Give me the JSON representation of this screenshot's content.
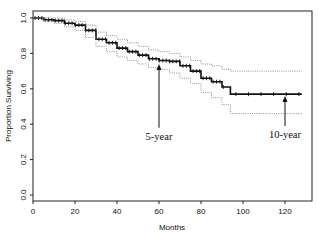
{
  "chart_data": {
    "type": "line",
    "title": "",
    "xlabel": "Months",
    "ylabel": "Proportion Surviving",
    "xlim": [
      0,
      130
    ],
    "ylim": [
      0,
      1.0
    ],
    "x_ticks": [
      0,
      20,
      40,
      60,
      80,
      100,
      120
    ],
    "y_ticks": [
      0.0,
      0.2,
      0.4,
      0.6,
      0.8,
      1.0
    ],
    "x_tick_labels": [
      "0",
      "20",
      "40",
      "60",
      "80",
      "100",
      "120"
    ],
    "y_tick_labels": [
      "0.0",
      "0.2",
      "0.4",
      "0.6",
      "0.8",
      "1.0"
    ],
    "grid": false,
    "legend": null,
    "series": [
      {
        "name": "Kaplan-Meier estimate",
        "style": "step-solid-with-censor-marks",
        "x": [
          0,
          5,
          10,
          15,
          20,
          25,
          30,
          35,
          40,
          45,
          50,
          55,
          60,
          65,
          70,
          75,
          80,
          85,
          90,
          94,
          100,
          110,
          120,
          128
        ],
        "y": [
          1.0,
          0.99,
          0.985,
          0.97,
          0.96,
          0.93,
          0.88,
          0.86,
          0.83,
          0.81,
          0.79,
          0.77,
          0.76,
          0.755,
          0.73,
          0.7,
          0.66,
          0.64,
          0.61,
          0.57,
          0.57,
          0.57,
          0.57,
          0.57
        ]
      },
      {
        "name": "Upper 95% CI",
        "style": "dotted",
        "x": [
          0,
          5,
          10,
          15,
          20,
          25,
          30,
          35,
          40,
          45,
          50,
          55,
          60,
          65,
          70,
          75,
          80,
          85,
          90,
          94,
          100,
          110,
          120,
          128
        ],
        "y": [
          1.0,
          1.0,
          1.0,
          0.99,
          0.98,
          0.96,
          0.92,
          0.9,
          0.88,
          0.86,
          0.84,
          0.82,
          0.81,
          0.8,
          0.78,
          0.76,
          0.74,
          0.73,
          0.71,
          0.7,
          0.7,
          0.7,
          0.7,
          0.7
        ]
      },
      {
        "name": "Lower 95% CI",
        "style": "dotted",
        "x": [
          0,
          5,
          10,
          15,
          20,
          25,
          30,
          35,
          40,
          45,
          50,
          55,
          60,
          65,
          70,
          75,
          80,
          85,
          90,
          94,
          100,
          110,
          120,
          128
        ],
        "y": [
          1.0,
          0.98,
          0.97,
          0.95,
          0.93,
          0.89,
          0.84,
          0.81,
          0.78,
          0.76,
          0.74,
          0.72,
          0.71,
          0.69,
          0.66,
          0.63,
          0.58,
          0.55,
          0.51,
          0.46,
          0.46,
          0.46,
          0.46,
          0.46
        ]
      }
    ],
    "annotations": [
      {
        "text": "5-year",
        "x": 60,
        "y_arrow_tip": 0.74,
        "y_arrow_tail": 0.38
      },
      {
        "text": "10-year",
        "x": 120,
        "y_arrow_tip": 0.56,
        "y_arrow_tail": 0.39
      }
    ]
  }
}
